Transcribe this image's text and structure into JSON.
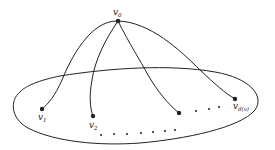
{
  "diagram": {
    "type": "graph-star-into-region",
    "colors": {
      "stroke": "#222222",
      "background": "#ffffff"
    },
    "center_vertex": {
      "label": "v",
      "subscript": "0",
      "x": 118,
      "y": 21
    },
    "neighbors": [
      {
        "label": "v",
        "subscript": "1",
        "x": 42,
        "y": 109
      },
      {
        "label": "v",
        "subscript": "2",
        "x": 93,
        "y": 116
      },
      {
        "label": "",
        "subscript": "",
        "x": 179,
        "y": 113
      },
      {
        "label": "v",
        "subscript": "d(v)",
        "x": 235,
        "y": 99
      }
    ],
    "ellipsis_dots_right": [
      [
        196,
        111
      ],
      [
        209,
        109
      ],
      [
        219,
        107
      ]
    ],
    "ellipsis_dots_bottom": [
      [
        101,
        135
      ],
      [
        114,
        134
      ],
      [
        127,
        134
      ],
      [
        141,
        133
      ],
      [
        153,
        132
      ],
      [
        165,
        131
      ],
      [
        175,
        130
      ]
    ]
  }
}
